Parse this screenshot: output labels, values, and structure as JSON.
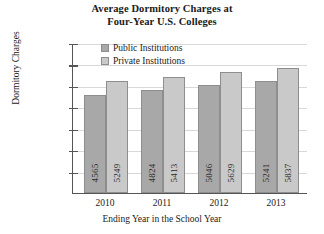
{
  "chart_data": {
    "type": "bar",
    "title": "Average Dormitory Charges at Four-Year U.S. Colleges",
    "title_line1": "Average Dormitory Charges at",
    "title_line2": "Four-Year U.S. Colleges",
    "xlabel": "Ending Year in the School Year",
    "ylabel": "Dormitory Charges",
    "categories": [
      "2010",
      "2011",
      "2012",
      "2013"
    ],
    "series": [
      {
        "name": "Public Institutions",
        "values": [
          4565,
          4824,
          5046,
          5241
        ],
        "color": "#a8a8a8"
      },
      {
        "name": "Private Institutions",
        "values": [
          5249,
          5413,
          5629,
          5837
        ],
        "color": "#c9c9c9"
      }
    ],
    "ylim": [
      0,
      7000
    ],
    "ytick_values": [
      1000,
      2000,
      3000,
      4000,
      5000,
      6000,
      7000
    ],
    "ytick_labels": [
      "$1000",
      "$2000",
      "$3000",
      "$4000",
      "$5000",
      "$6000",
      "$7000"
    ],
    "grid": true,
    "legend_position": "inside-top-left",
    "bar_labels": [
      [
        "4565",
        "5249"
      ],
      [
        "4824",
        "5413"
      ],
      [
        "5046",
        "5629"
      ],
      [
        "5241",
        "5837"
      ]
    ]
  },
  "legend": {
    "items": [
      {
        "label": "Public Institutions",
        "color": "#a8a8a8"
      },
      {
        "label": "Private Institutions",
        "color": "#c9c9c9"
      }
    ]
  }
}
